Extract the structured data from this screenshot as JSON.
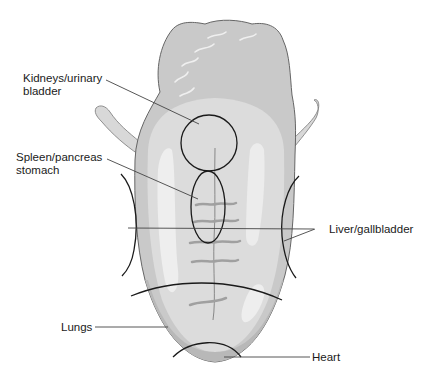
{
  "figure": {
    "colors": {
      "tongue_body": "#c9c9c9",
      "tongue_mid": "#dedede",
      "tongue_highlight": "#f0f0f0",
      "edge_band": "#b5b5b5",
      "outline": "#555555",
      "zone_line": "#1a1a1a",
      "leader_line": "#444444"
    }
  },
  "labels": {
    "kidneys_line1": "Kidneys/urinary",
    "kidneys_line2": "bladder",
    "spleen_line1": "Spleen/pancreas",
    "spleen_line2": "stomach",
    "liver": "Liver/gallbladder",
    "lungs": "Lungs",
    "heart": "Heart"
  }
}
